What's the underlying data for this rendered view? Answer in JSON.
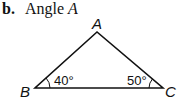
{
  "heading": {
    "label": "b.",
    "text": "Angle ",
    "variable": "A"
  },
  "triangle": {
    "vertices": [
      {
        "name": "A",
        "angle": null
      },
      {
        "name": "B",
        "angle": "40°"
      },
      {
        "name": "C",
        "angle": "50°"
      }
    ]
  },
  "colors": {
    "stroke": "#111111",
    "background": "#ffffff"
  }
}
